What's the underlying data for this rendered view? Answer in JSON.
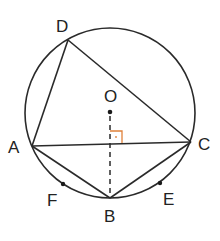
{
  "diagram": {
    "type": "circle-geometry",
    "circle_center_label": "O",
    "points": {
      "D": "D",
      "A": "A",
      "C": "C",
      "B": "B",
      "O": "O",
      "F": "F",
      "E": "E"
    },
    "segments": [
      "AC",
      "AD",
      "DC",
      "AB",
      "BC"
    ],
    "dashed_segments": [
      "OB"
    ],
    "right_angle": {
      "at": "intersection of OB and AC",
      "color": "#e0813a"
    },
    "arc_points": [
      "F",
      "E"
    ],
    "colors": {
      "line": "#2a2a2a",
      "right_angle_marker": "#e0813a",
      "background": "#ffffff"
    }
  }
}
